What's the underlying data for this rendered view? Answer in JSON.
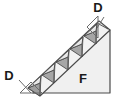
{
  "figure": {
    "canvas": {
      "width": 116,
      "height": 105,
      "background": "#ffffff"
    },
    "labels": {
      "body": "F",
      "tooth_bottom_left": "D",
      "tooth_top_right": "D"
    },
    "label_font_size": "13",
    "small_label_font_size": "12",
    "colors": {
      "outline": "#4a4a4a",
      "body_fill": "#f0f0f0",
      "tooth_light": "#e8e8e8",
      "tooth_dark": "#a6a6a6",
      "leader": "#6b6b6b",
      "text": "#1a1a1a"
    },
    "geometry": {
      "main_triangle_points": "33,93 110,93 110,30",
      "strip_band_points": "28,88 99,21 110,30 40,96",
      "callout_triangle_bottom_left_points": "20,93 42,93 31,82",
      "callout_triangle_top_right_points": "98,38 98,16 87,27",
      "leader_bottom_left": {
        "x1": 19,
        "y1": 80,
        "x2": 31,
        "y2": 93
      },
      "leader_top_right": {
        "x1": 104,
        "y1": 17,
        "x2": 97,
        "y2": 28
      }
    },
    "teeth": {
      "count_light": 6,
      "count_dark": 5,
      "description": "alternating light up-pointing and dark down-pointing triangles along hypotenuse"
    }
  }
}
